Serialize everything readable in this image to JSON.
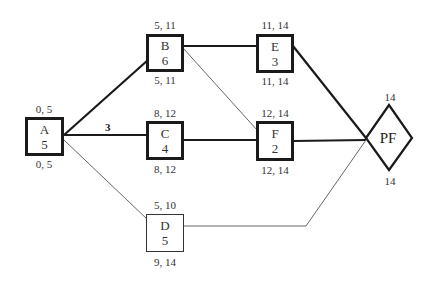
{
  "diagram": {
    "type": "activity-on-node network",
    "nodes": [
      {
        "id": "A",
        "duration": "5",
        "top": "0, 5",
        "bottom": "0, 5",
        "critical": true
      },
      {
        "id": "B",
        "duration": "6",
        "top": "5, 11",
        "bottom": "5, 11",
        "critical": true
      },
      {
        "id": "C",
        "duration": "4",
        "top": "8, 12",
        "bottom": "8, 12",
        "critical": true
      },
      {
        "id": "D",
        "duration": "5",
        "top": "5, 10",
        "bottom": "9, 14",
        "critical": false
      },
      {
        "id": "E",
        "duration": "3",
        "top": "11, 14",
        "bottom": "11, 14",
        "critical": true
      },
      {
        "id": "F",
        "duration": "2",
        "top": "12, 14",
        "bottom": "12, 14",
        "critical": true
      }
    ],
    "finish": {
      "id": "PF",
      "top": "14",
      "bottom": "14"
    },
    "edges": [
      {
        "from": "A",
        "to": "B",
        "critical": true
      },
      {
        "from": "A",
        "to": "C",
        "critical": true,
        "label": "3"
      },
      {
        "from": "A",
        "to": "D",
        "critical": false
      },
      {
        "from": "B",
        "to": "E",
        "critical": true
      },
      {
        "from": "B",
        "to": "F",
        "critical": false
      },
      {
        "from": "C",
        "to": "F",
        "critical": true
      },
      {
        "from": "E",
        "to": "PF",
        "critical": true
      },
      {
        "from": "F",
        "to": "PF",
        "critical": true
      },
      {
        "from": "D",
        "to": "PF",
        "critical": false
      }
    ],
    "edge_label_AC": "3"
  }
}
